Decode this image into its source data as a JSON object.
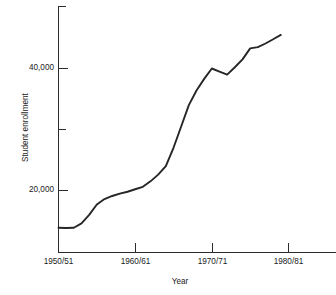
{
  "chart_data": {
    "type": "line",
    "title": "",
    "subtitle": "",
    "xlabel": "Year",
    "ylabel": "Student enrollment",
    "grid": false,
    "legend": "none",
    "xtick_labels": [
      "1950/51",
      "1960/61",
      "1970/71",
      "1980/81"
    ],
    "xtick_values": [
      1950,
      1960,
      1970,
      1980
    ],
    "ytick_labels": [
      "20,000",
      "40,000"
    ],
    "ytick_values": [
      20000,
      40000
    ],
    "yminor_tick_values": [
      30000
    ],
    "xlim": [
      1950,
      1986.4
    ],
    "ylim": [
      9700,
      49800
    ],
    "x": [
      1950,
      1951,
      1952,
      1953,
      1954,
      1955,
      1956,
      1957,
      1958,
      1959,
      1960,
      1961,
      1962,
      1963,
      1964,
      1965,
      1966,
      1967,
      1968,
      1969,
      1970,
      1971,
      1972,
      1973,
      1974,
      1975,
      1976,
      1977,
      1978,
      1979
    ],
    "values": [
      13900,
      13850,
      13900,
      14600,
      16000,
      17700,
      18600,
      19100,
      19500,
      19800,
      20200,
      20600,
      21500,
      22600,
      24000,
      27000,
      30500,
      34000,
      36400,
      38300,
      40000,
      39500,
      39000,
      40200,
      41500,
      43300,
      43500,
      44100,
      44800,
      45500
    ],
    "series": [
      {
        "name": "Student enrollment",
        "values": [
          13900,
          13850,
          13900,
          14600,
          16000,
          17700,
          18600,
          19100,
          19500,
          19800,
          20200,
          20600,
          21500,
          22600,
          24000,
          27000,
          30500,
          34000,
          36400,
          38300,
          40000,
          39500,
          39000,
          40200,
          41500,
          43300,
          43500,
          44100,
          44800,
          45500
        ]
      }
    ],
    "annotations": [],
    "line_color": "#262626",
    "axis_color": "#2b2b2b"
  },
  "axis": {
    "y_title": "Student enrollment",
    "x_title": "Year"
  }
}
